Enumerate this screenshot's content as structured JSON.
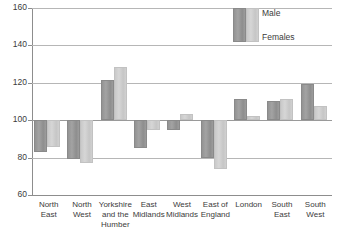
{
  "chart_data": {
    "type": "bar",
    "title": "",
    "subtitle": "",
    "xlabel": "",
    "ylabel": "",
    "ylim": [
      60,
      160
    ],
    "ytick_values": [
      160,
      140,
      120,
      100,
      80,
      60
    ],
    "ytick_labels": [
      "160",
      "140",
      "120",
      "100",
      "80",
      "60"
    ],
    "grid": true,
    "baseline": 100,
    "legend_position": "top-right",
    "categories": [
      "North East",
      "North West",
      "Yorkshire and the Humber",
      "East Midlands",
      "West Midlands",
      "East of England",
      "London",
      "South East",
      "South West"
    ],
    "category_lines": [
      [
        "North",
        "East"
      ],
      [
        "North",
        "West"
      ],
      [
        "Yorkshire",
        "and the",
        "Humber"
      ],
      [
        "East",
        "Midlands"
      ],
      [
        "West",
        "Midlands"
      ],
      [
        "East of",
        "England"
      ],
      [
        "London"
      ],
      [
        "South",
        "East"
      ],
      [
        "South",
        "West"
      ]
    ],
    "series": [
      {
        "name": "Male",
        "color": "#9a9a9a",
        "values": [
          83,
          79,
          121.5,
          85,
          95,
          80,
          111.5,
          110.5,
          119.5
        ]
      },
      {
        "name": "Females",
        "color": "#cdcdcd",
        "values": [
          85.5,
          77,
          128.5,
          94.5,
          103.5,
          74,
          102.5,
          111.5,
          107.5
        ]
      }
    ]
  },
  "legend": {
    "male_label": "Male",
    "female_label": "Females"
  }
}
